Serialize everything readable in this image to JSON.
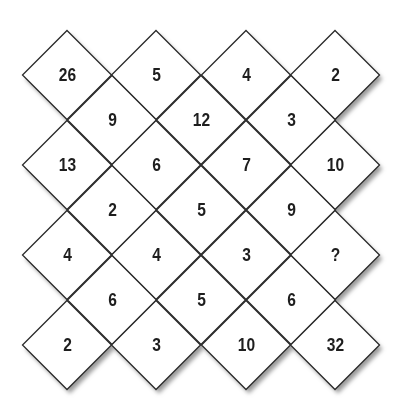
{
  "puzzle": {
    "type": "diamond-number-grid",
    "missing_symbol": "?",
    "rows": [
      {
        "y": 75,
        "cells": [
          {
            "x": 67,
            "value": "26"
          },
          {
            "x": 156,
            "value": "5"
          },
          {
            "x": 246,
            "value": "4"
          },
          {
            "x": 335,
            "value": "2"
          }
        ]
      },
      {
        "y": 120,
        "cells": [
          {
            "x": 112,
            "value": "9"
          },
          {
            "x": 201,
            "value": "12"
          },
          {
            "x": 291,
            "value": "3"
          }
        ]
      },
      {
        "y": 165,
        "cells": [
          {
            "x": 67,
            "value": "13"
          },
          {
            "x": 156,
            "value": "6"
          },
          {
            "x": 246,
            "value": "7"
          },
          {
            "x": 335,
            "value": "10"
          }
        ]
      },
      {
        "y": 210,
        "cells": [
          {
            "x": 112,
            "value": "2"
          },
          {
            "x": 201,
            "value": "5"
          },
          {
            "x": 291,
            "value": "9"
          }
        ]
      },
      {
        "y": 255,
        "cells": [
          {
            "x": 67,
            "value": "4"
          },
          {
            "x": 156,
            "value": "4"
          },
          {
            "x": 246,
            "value": "3"
          },
          {
            "x": 335,
            "value": "?"
          }
        ]
      },
      {
        "y": 300,
        "cells": [
          {
            "x": 112,
            "value": "6"
          },
          {
            "x": 201,
            "value": "5"
          },
          {
            "x": 291,
            "value": "6"
          }
        ]
      },
      {
        "y": 345,
        "cells": [
          {
            "x": 67,
            "value": "2"
          },
          {
            "x": 156,
            "value": "3"
          },
          {
            "x": 246,
            "value": "10"
          },
          {
            "x": 335,
            "value": "32"
          }
        ]
      }
    ]
  },
  "colors": {
    "line": "#2a2a2a",
    "fill": "#ffffff",
    "text": "#1e1e1e",
    "shadow": "#9a9a9a"
  }
}
